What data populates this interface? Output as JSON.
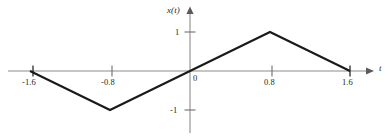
{
  "figure": {
    "background_color": "#ffffff",
    "waveform_color": "#1a1a1a",
    "axis_color": "#8c8c8c",
    "text_color": "#1f1f1f"
  },
  "labels": {
    "y_axis_name": "x(t)",
    "x_axis_name": "t",
    "origin": "0",
    "y_tick_pos": "1",
    "y_tick_neg": "-1",
    "x_tick_neg16": "-1.6",
    "x_tick_neg08": "-0.8",
    "x_tick_pos08": "0.8",
    "x_tick_pos16": "1.6"
  },
  "chart_data": {
    "type": "line",
    "title": "",
    "subtitle": "",
    "xlabel": "t",
    "ylabel": "x(t)",
    "series": [
      {
        "name": "x(t)",
        "x": [
          -1.6,
          -0.8,
          0,
          0.8,
          1.6
        ],
        "values": [
          0,
          -1,
          0,
          1,
          0
        ]
      }
    ],
    "xlim": [
      -1.85,
      1.85
    ],
    "ylim": [
      -1.55,
      1.45
    ],
    "xticks": [
      -1.6,
      -0.8,
      0.8,
      1.6
    ],
    "xticklabels": [
      "-1.6",
      "-0.8",
      "0.8",
      "1.6"
    ],
    "yticks": [
      -1,
      1
    ],
    "yticklabels": [
      "-1",
      "1"
    ],
    "grid": false,
    "legend": false,
    "legend_position": "none",
    "annotations": [
      "0"
    ]
  }
}
